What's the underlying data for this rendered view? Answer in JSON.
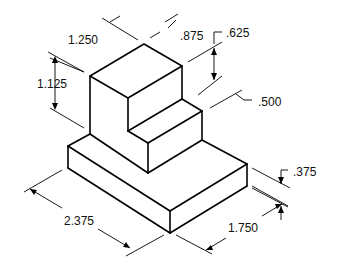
{
  "drawing": {
    "type": "isometric stepped block",
    "dimensions": {
      "top_width": "1.250",
      "upper_height": "1.125",
      "step_depth": ".875",
      "step_height": ".625",
      "step_offset": ".500",
      "base_thickness": ".375",
      "base_length": "2.375",
      "base_width": "1.750"
    }
  }
}
